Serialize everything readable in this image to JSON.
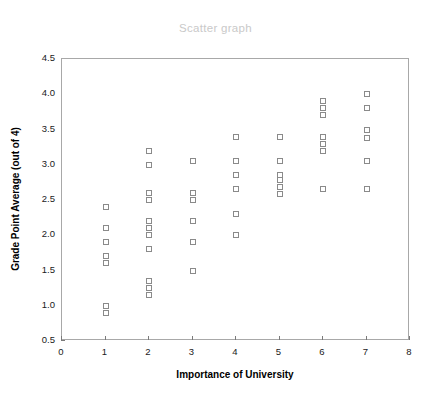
{
  "chart_data": {
    "type": "scatter",
    "title": "Scatter graph",
    "xlabel": "Importance of University",
    "ylabel": "Grade Point Average (out of 4)",
    "xlim": [
      0,
      8
    ],
    "ylim": [
      0.5,
      4.5
    ],
    "xticks": [
      0,
      1,
      2,
      3,
      4,
      5,
      6,
      7,
      8
    ],
    "xtick_labels": [
      "0",
      "1",
      "2",
      "3",
      "4",
      "5",
      "6",
      "7",
      "8"
    ],
    "yticks": [
      0.5,
      1.0,
      1.5,
      2.0,
      2.5,
      3.0,
      3.5,
      4.0,
      4.5
    ],
    "ytick_labels": [
      "0.5",
      "1.0",
      "1.5",
      "2.0",
      "2.5",
      "3.0",
      "3.5",
      "4.0",
      "4.5"
    ],
    "grid": false,
    "legend": false,
    "marker": "open-square",
    "marker_edge_color": "#8a8a8a",
    "marker_face_color": "#ffffff",
    "title_color": "#c9c9c9",
    "axis_color": "#a8a8a8",
    "points": [
      {
        "x": 1,
        "y": 2.4
      },
      {
        "x": 1,
        "y": 2.1
      },
      {
        "x": 1,
        "y": 1.9
      },
      {
        "x": 1,
        "y": 1.7
      },
      {
        "x": 1,
        "y": 1.6
      },
      {
        "x": 1,
        "y": 1.0
      },
      {
        "x": 1,
        "y": 0.9
      },
      {
        "x": 2,
        "y": 3.2
      },
      {
        "x": 2,
        "y": 3.0
      },
      {
        "x": 2,
        "y": 2.6
      },
      {
        "x": 2,
        "y": 2.5
      },
      {
        "x": 2,
        "y": 2.2
      },
      {
        "x": 2,
        "y": 2.1
      },
      {
        "x": 2,
        "y": 2.0
      },
      {
        "x": 2,
        "y": 1.8
      },
      {
        "x": 2,
        "y": 1.35
      },
      {
        "x": 2,
        "y": 1.25
      },
      {
        "x": 2,
        "y": 1.15
      },
      {
        "x": 3,
        "y": 3.05
      },
      {
        "x": 3,
        "y": 2.6
      },
      {
        "x": 3,
        "y": 2.5
      },
      {
        "x": 3,
        "y": 2.2
      },
      {
        "x": 3,
        "y": 1.9
      },
      {
        "x": 3,
        "y": 1.5
      },
      {
        "x": 4,
        "y": 3.4
      },
      {
        "x": 4,
        "y": 3.05
      },
      {
        "x": 4,
        "y": 2.85
      },
      {
        "x": 4,
        "y": 2.65
      },
      {
        "x": 4,
        "y": 2.3
      },
      {
        "x": 4,
        "y": 2.0
      },
      {
        "x": 5,
        "y": 3.4
      },
      {
        "x": 5,
        "y": 3.05
      },
      {
        "x": 5,
        "y": 2.85
      },
      {
        "x": 5,
        "y": 2.78
      },
      {
        "x": 5,
        "y": 2.68
      },
      {
        "x": 5,
        "y": 2.58
      },
      {
        "x": 6,
        "y": 3.9
      },
      {
        "x": 6,
        "y": 3.8
      },
      {
        "x": 6,
        "y": 3.7
      },
      {
        "x": 6,
        "y": 3.4
      },
      {
        "x": 6,
        "y": 3.3
      },
      {
        "x": 6,
        "y": 3.2
      },
      {
        "x": 6,
        "y": 2.65
      },
      {
        "x": 7,
        "y": 4.0
      },
      {
        "x": 7,
        "y": 3.8
      },
      {
        "x": 7,
        "y": 3.5
      },
      {
        "x": 7,
        "y": 3.38
      },
      {
        "x": 7,
        "y": 3.05
      },
      {
        "x": 7,
        "y": 2.65
      }
    ]
  }
}
